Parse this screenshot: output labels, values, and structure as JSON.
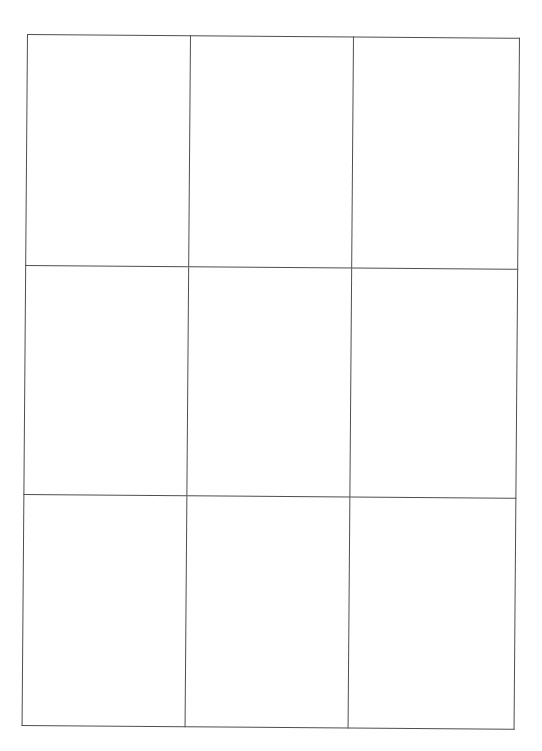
{
  "document": {
    "type": "scanned-grid-table",
    "title": "Empty 3x3 Grid Table",
    "background_color": "#ffffff",
    "page_width": 542,
    "page_height": 751
  },
  "grid": {
    "rows": 3,
    "columns": 3,
    "line_color": "#4f4f4f",
    "line_width_px": 1.4,
    "frame": {
      "left": 27,
      "top": 34,
      "right": 516,
      "bottom": 722,
      "width": 489,
      "height": 688
    },
    "vertical_divider_x": [
      189,
      351
    ],
    "horizontal_divider_y": [
      264,
      492
    ],
    "skew_degrees": 0.45,
    "column_widths": [
      162,
      162,
      165
    ],
    "row_heights": [
      230,
      228,
      230
    ],
    "cells": [
      [
        {
          "id": "r1c1",
          "text": ""
        },
        {
          "id": "r1c2",
          "text": ""
        },
        {
          "id": "r1c3",
          "text": ""
        }
      ],
      [
        {
          "id": "r2c1",
          "text": ""
        },
        {
          "id": "r2c2",
          "text": ""
        },
        {
          "id": "r2c3",
          "text": ""
        }
      ],
      [
        {
          "id": "r3c1",
          "text": ""
        },
        {
          "id": "r3c2",
          "text": ""
        },
        {
          "id": "r3c3",
          "text": ""
        }
      ]
    ]
  }
}
